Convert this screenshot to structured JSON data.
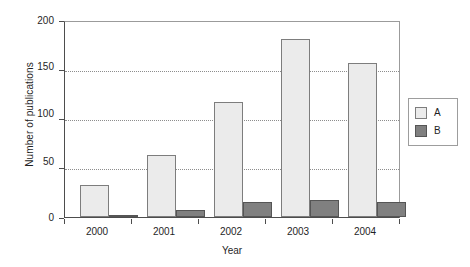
{
  "chart_data": {
    "type": "bar",
    "title": "",
    "xlabel": "Year",
    "ylabel": "Number of publications",
    "categories": [
      "2000",
      "2001",
      "2002",
      "2003",
      "2004"
    ],
    "series": [
      {
        "name": "A",
        "color": "#ebebeb",
        "values": [
          33,
          64,
          118,
          183,
          158
        ]
      },
      {
        "name": "B",
        "color": "#808080",
        "values": [
          1,
          7,
          15,
          17,
          15
        ]
      }
    ],
    "ylim": [
      0,
      200
    ],
    "yticks": [
      0,
      50,
      100,
      150,
      200
    ],
    "ytick_labels": [
      "0",
      "50",
      "100",
      "150",
      "200"
    ],
    "grid": true,
    "grid_axis": "y",
    "legend_position": "right-outside",
    "legend_entries": [
      "A",
      "B"
    ]
  },
  "axes": {
    "y_title": "Number of publications",
    "x_title": "Year",
    "y_labels": [
      "200",
      "150",
      "100",
      "50",
      "0"
    ],
    "x_labels": [
      "2000",
      "2001",
      "2002",
      "2003",
      "2004"
    ]
  },
  "legend": {
    "items": [
      {
        "label": "A"
      },
      {
        "label": "B"
      }
    ]
  },
  "colors": {
    "series_a_fill": "#ebebeb",
    "series_a_edge": "#7d7d7d",
    "series_b_fill": "#808080",
    "series_b_edge": "#555555",
    "axis": "#4d4d4d",
    "grid": "#8d8d8d",
    "frame": "#9b9b9b",
    "background": "#ffffff"
  }
}
